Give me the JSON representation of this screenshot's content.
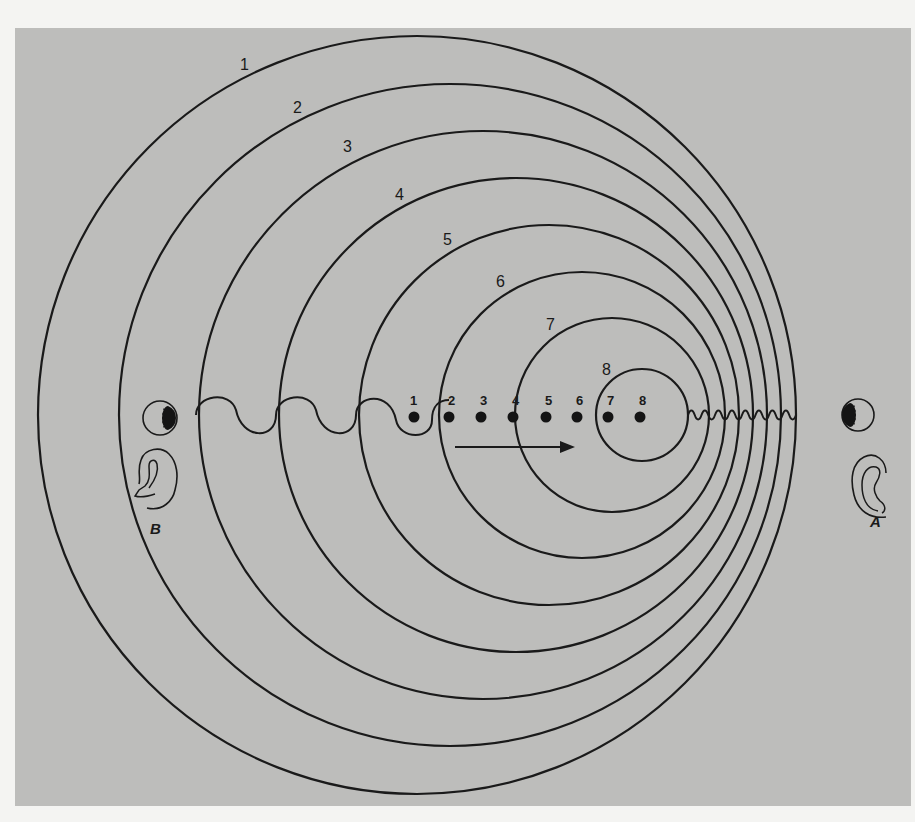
{
  "figure": {
    "panel_color": "#bdbdbb",
    "line_color": "#1a1a1a",
    "wavefronts": [
      {
        "label": "1",
        "cx": 417,
        "r": 379,
        "label_x": 240,
        "label_y": 70
      },
      {
        "label": "2",
        "cx": 450,
        "r": 331,
        "label_x": 293,
        "label_y": 113
      },
      {
        "label": "3",
        "cx": 483,
        "r": 284,
        "label_x": 343,
        "label_y": 152
      },
      {
        "label": "4",
        "cx": 516,
        "r": 237,
        "label_x": 395,
        "label_y": 200
      },
      {
        "label": "5",
        "cx": 549,
        "r": 190,
        "label_x": 443,
        "label_y": 245
      },
      {
        "label": "6",
        "cx": 582,
        "r": 143,
        "label_x": 496,
        "label_y": 287
      },
      {
        "label": "7",
        "cx": 612,
        "r": 97,
        "label_x": 546,
        "label_y": 330
      },
      {
        "label": "8",
        "cx": 642,
        "r": 46,
        "label_x": 602,
        "label_y": 375
      }
    ],
    "center_y": 415,
    "source_positions": [
      {
        "label": "1",
        "x": 414
      },
      {
        "label": "2",
        "x": 449
      },
      {
        "label": "3",
        "x": 481
      },
      {
        "label": "4",
        "x": 513
      },
      {
        "label": "5",
        "x": 546
      },
      {
        "label": "6",
        "x": 577
      },
      {
        "label": "7",
        "x": 608
      },
      {
        "label": "8",
        "x": 640
      }
    ],
    "motion_arrow": {
      "x1": 455,
      "x2": 575,
      "y": 447,
      "direction": "right"
    },
    "observers": [
      {
        "label": "B",
        "side": "left",
        "eye_icon": "eye-icon",
        "ear_icon": "ear-icon"
      },
      {
        "label": "A",
        "side": "right",
        "eye_icon": "eye-icon",
        "ear_icon": "ear-icon"
      }
    ],
    "wave_left_note": "long wavelength (stretched) toward observer B",
    "wave_right_note": "short wavelength (compressed) toward observer A"
  }
}
